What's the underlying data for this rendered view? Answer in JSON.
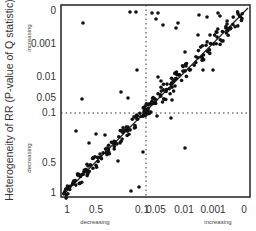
{
  "chart_data": {
    "type": "scatter",
    "title": "",
    "xlabel": "",
    "ylabel": "Heterogeneity of RR (P-value of Q statistic)",
    "x_ticks": [
      "1",
      "0.5",
      "0.1",
      "0.05",
      "0.01",
      "0.001",
      "0"
    ],
    "y_ticks": [
      "0",
      "0.001",
      "0.01",
      "0.05",
      "0.1",
      "0.5",
      "1"
    ],
    "x_direction_labels": {
      "left": "decreasing",
      "right": "increasing"
    },
    "y_direction_labels": {
      "top": "increasing",
      "bottom": "decreasing"
    },
    "reference_lines": {
      "diagonal": "y = x (identity line)",
      "vertical_dotted": 0.1,
      "horizontal_dotted": 0.1
    },
    "grid": false,
    "legend": "none",
    "approx_points_count": 300
  },
  "axes": {
    "y_label": "Heterogeneity of RR (P-value of Q statistic)",
    "y_top": "increasing",
    "y_bottom": "decreasing",
    "x_left": "decreasing",
    "x_right": "increasing"
  }
}
